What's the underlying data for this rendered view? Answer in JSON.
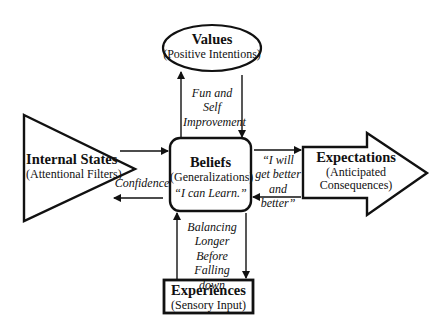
{
  "diagram": {
    "nodes": {
      "values": {
        "title": "Values",
        "subtitle": "(Positive Intentions)",
        "shape": "ellipse"
      },
      "internal_states": {
        "title": "Internal States",
        "subtitle": "(Attentional Filters)",
        "shape": "triangle"
      },
      "beliefs": {
        "title": "Beliefs",
        "subtitle": "(Generalizations)",
        "quote": "“I can Learn.”",
        "shape": "rounded-rectangle"
      },
      "expectations": {
        "title": "Expectations",
        "subtitle_line1": "(Anticipated",
        "subtitle_line2": "Consequences)",
        "shape": "block-arrow"
      },
      "experiences": {
        "title": "Experiences",
        "subtitle": "(Sensory Input)",
        "shape": "rectangle"
      }
    },
    "annotations": {
      "values_beliefs": [
        "Fun and",
        "Self",
        "Improvement"
      ],
      "internal_beliefs": [
        "Confidence"
      ],
      "beliefs_expectations": [
        "“I will",
        "get better",
        "and better”"
      ],
      "beliefs_experiences": [
        "Balancing",
        "Longer",
        "Before",
        "Falling down"
      ]
    },
    "colors": {
      "stroke": "#111111",
      "background": "#ffffff"
    }
  }
}
